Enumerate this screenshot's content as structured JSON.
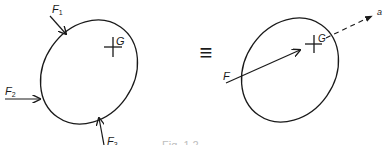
{
  "figure": {
    "left_body": {
      "centroid_label": "G",
      "forces": [
        {
          "id": "F1",
          "label_main": "F",
          "label_sub": "1"
        },
        {
          "id": "F2",
          "label_main": "F",
          "label_sub": "2"
        },
        {
          "id": "F3",
          "label_main": "F",
          "label_sub": "3"
        }
      ]
    },
    "equivalence_symbol": "≡",
    "right_body": {
      "centroid_label": "G",
      "resultant_label": "F",
      "axis_label": "a"
    },
    "caption": "Fig. 1.2"
  }
}
